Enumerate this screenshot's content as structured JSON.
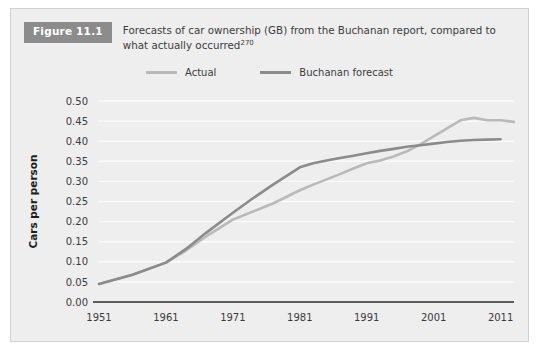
{
  "figure": {
    "badge": "Figure 11.1",
    "caption_line1": "Forecasts of car ownership (GB) from the Buchanan report, compared to",
    "caption_line2": "what actually occurred",
    "caption_superscript": "270"
  },
  "colors": {
    "card_background": "#eeeeee",
    "badge_background": "#8c8c8c",
    "actual_line": "#b9b9b9",
    "forecast_line": "#8b8b8b",
    "gridline": "#fbfbfb",
    "axis": "#2b2b2b",
    "text": "#3b3b3b"
  },
  "chart_data": {
    "type": "line",
    "title": "Forecasts of car ownership (GB) from the Buchanan report, compared to what actually occurred",
    "xlabel": "",
    "ylabel": "Cars per person",
    "xlim": [
      1951,
      2013
    ],
    "ylim": [
      0.0,
      0.5
    ],
    "grid": true,
    "legend_position": "top-center",
    "ytick_labels": [
      "0.00",
      "0.05",
      "0.10",
      "0.15",
      "0.20",
      "0.25",
      "0.30",
      "0.35",
      "0.40",
      "0.45",
      "0.50"
    ],
    "ytick_values": [
      0.0,
      0.05,
      0.1,
      0.15,
      0.2,
      0.25,
      0.3,
      0.35,
      0.4,
      0.45,
      0.5
    ],
    "xtick_labels": [
      "1951",
      "1961",
      "1971",
      "1981",
      "1991",
      "2001",
      "2011"
    ],
    "xtick_values": [
      1951,
      1961,
      1971,
      1981,
      1991,
      2001,
      2011
    ],
    "series": [
      {
        "name": "Actual",
        "color": "#b9b9b9",
        "x": [
          1951,
          1956,
          1961,
          1964,
          1967,
          1971,
          1974,
          1977,
          1981,
          1983,
          1985,
          1987,
          1989,
          1991,
          1993,
          1995,
          1997,
          1999,
          2001,
          2003,
          2005,
          2007,
          2009,
          2011,
          2013
        ],
        "y": [
          0.045,
          0.068,
          0.098,
          0.128,
          0.163,
          0.205,
          0.225,
          0.245,
          0.278,
          0.292,
          0.305,
          0.318,
          0.332,
          0.345,
          0.352,
          0.362,
          0.375,
          0.392,
          0.412,
          0.432,
          0.452,
          0.458,
          0.452,
          0.452,
          0.448
        ]
      },
      {
        "name": "Buchanan forecast",
        "color": "#8b8b8b",
        "x": [
          1951,
          1956,
          1961,
          1964,
          1967,
          1971,
          1974,
          1977,
          1981,
          1983,
          1985,
          1987,
          1989,
          1991,
          1993,
          1995,
          1997,
          1999,
          2001,
          2003,
          2005,
          2007,
          2009,
          2011
        ],
        "y": [
          0.045,
          0.068,
          0.098,
          0.132,
          0.172,
          0.222,
          0.258,
          0.292,
          0.335,
          0.345,
          0.352,
          0.358,
          0.364,
          0.37,
          0.376,
          0.381,
          0.386,
          0.39,
          0.394,
          0.398,
          0.401,
          0.403,
          0.404,
          0.405
        ]
      }
    ]
  },
  "legend": [
    {
      "label": "Actual"
    },
    {
      "label": "Buchanan forecast"
    }
  ]
}
